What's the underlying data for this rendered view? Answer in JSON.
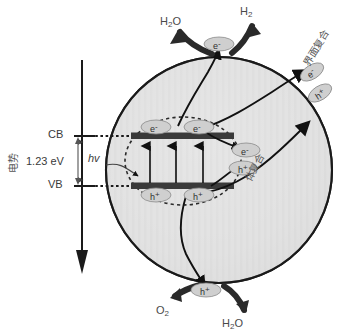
{
  "diagram": {
    "axis": {
      "name": "potential-axis",
      "label": "电势",
      "direction": "downward"
    },
    "band_structure": {
      "conduction_band_label": "CB",
      "valence_band_label": "VB",
      "band_gap_value": "1.23 eV",
      "photon_label": "hv",
      "excitation_arrows": 3
    },
    "carriers": {
      "electron_symbol": "e",
      "electron_charge": "-",
      "hole_symbol": "h",
      "hole_charge": "+",
      "cb_electrons": [
        "e",
        "e"
      ],
      "vb_holes": [
        "h",
        "h"
      ],
      "bulk_electron": "e",
      "bulk_hole": "h",
      "surface_electron": "e",
      "surface_hole": "h",
      "top_electron": "e",
      "bottom_hole": "h"
    },
    "reactions": {
      "top_reactant": "H2O",
      "top_reactant_formula": [
        "H",
        "2",
        "O"
      ],
      "top_product": "H2",
      "top_product_formula": [
        "H",
        "2"
      ],
      "bottom_product": "O2",
      "bottom_product_formula": [
        "O",
        "2"
      ],
      "bottom_reactant": "H2O",
      "bottom_reactant_formula": [
        "H",
        "2",
        "O"
      ]
    },
    "recombination": {
      "surface_label": "界面复合",
      "bulk_label": "体复合"
    },
    "colors": {
      "sphere_fill": "#e2e2e2",
      "sphere_stroke": "#1a1a1a",
      "band_bar": "#3a3a3a",
      "carrier_fill": "#cfcfcf",
      "text": "#4a4a4a",
      "arrow": "#111111"
    }
  }
}
